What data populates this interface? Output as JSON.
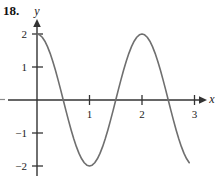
{
  "problem": {
    "number": "18."
  },
  "axes": {
    "x_label": "x",
    "y_label": "y",
    "x_ticks": [
      {
        "value": 1,
        "label": "1"
      },
      {
        "value": 2,
        "label": "2"
      },
      {
        "value": 3,
        "label": "3"
      }
    ],
    "y_ticks": [
      {
        "value": 2,
        "label": "2"
      },
      {
        "value": 1,
        "label": "1"
      },
      {
        "value": -1,
        "label": "−1"
      },
      {
        "value": -2,
        "label": "−2"
      }
    ],
    "origin_label": "",
    "axis_color": "#333333"
  },
  "chart_data": {
    "type": "line",
    "title": "",
    "xlabel": "x",
    "ylabel": "y",
    "xlim": [
      -0.12,
      3.35
    ],
    "ylim": [
      -2.45,
      2.35
    ],
    "grid": false,
    "legend": null,
    "curve_color": "#6f6f6f",
    "function": "y = 2 cos(pi x)",
    "amplitude": 2,
    "period": 2,
    "x_intercepts": [
      0.5,
      1.5,
      2.5
    ],
    "maxima": [
      {
        "x": 0,
        "y": 2
      },
      {
        "x": 2,
        "y": 2
      }
    ],
    "minima": [
      {
        "x": 1,
        "y": -2
      },
      {
        "x": 3,
        "y": -2
      }
    ],
    "x": [
      0,
      0.05,
      0.1,
      0.15,
      0.2,
      0.25,
      0.3,
      0.35,
      0.4,
      0.45,
      0.5,
      0.55,
      0.6,
      0.65,
      0.7,
      0.75,
      0.8,
      0.85,
      0.9,
      0.95,
      1,
      1.05,
      1.1,
      1.15,
      1.2,
      1.25,
      1.3,
      1.35,
      1.4,
      1.45,
      1.5,
      1.55,
      1.6,
      1.65,
      1.7,
      1.75,
      1.8,
      1.85,
      1.9,
      1.95,
      2,
      2.05,
      2.1,
      2.15,
      2.2,
      2.25,
      2.3,
      2.35,
      2.4,
      2.45,
      2.5,
      2.55,
      2.6,
      2.65,
      2.7,
      2.75,
      2.8,
      2.85,
      2.9
    ],
    "y": [
      2,
      1.975,
      1.902,
      1.782,
      1.618,
      1.414,
      1.176,
      0.908,
      0.618,
      0.313,
      0,
      -0.313,
      -0.618,
      -0.908,
      -1.176,
      -1.414,
      -1.618,
      -1.782,
      -1.902,
      -1.975,
      -2,
      -1.975,
      -1.902,
      -1.782,
      -1.618,
      -1.414,
      -1.176,
      -0.908,
      -0.618,
      -0.313,
      0,
      0.313,
      0.618,
      0.908,
      1.176,
      1.414,
      1.618,
      1.782,
      1.902,
      1.975,
      2,
      1.975,
      1.902,
      1.782,
      1.618,
      1.414,
      1.176,
      0.908,
      0.618,
      0.313,
      0,
      -0.313,
      -0.618,
      -0.908,
      -1.176,
      -1.414,
      -1.618,
      -1.782,
      -1.902
    ]
  },
  "geometry": {
    "origin_px": {
      "x": 37,
      "y": 100
    },
    "unit_px": {
      "x": 52.5,
      "y": 33
    },
    "x_axis_start_px": 8,
    "x_axis_end_px": 203,
    "y_axis_top_px": 22,
    "y_axis_bottom_px": 176,
    "curve_x_start": 0,
    "curve_x_end": 2.93
  }
}
